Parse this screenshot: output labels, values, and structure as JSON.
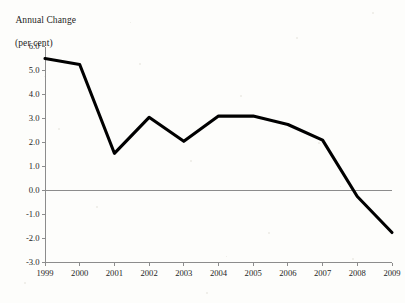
{
  "chart_data": {
    "type": "line",
    "title": "",
    "ylabel_line1": "Annual Change",
    "ylabel_line2": "(per cent)",
    "xlabel": "Year",
    "categories": [
      "1999",
      "2000",
      "2001",
      "2002",
      "2003",
      "2004",
      "2005",
      "2006",
      "2007",
      "2008",
      "2009"
    ],
    "x": [
      1999,
      2000,
      2001,
      2002,
      2003,
      2004,
      2005,
      2006,
      2007,
      2008,
      2009
    ],
    "values": [
      5.5,
      5.25,
      1.55,
      3.05,
      2.05,
      3.1,
      3.1,
      2.75,
      2.1,
      -0.25,
      -1.75
    ],
    "series": [
      {
        "name": "Annual Change (per cent)",
        "values": [
          5.5,
          5.25,
          1.55,
          3.05,
          2.05,
          3.1,
          3.1,
          2.75,
          2.1,
          -0.25,
          -1.75
        ],
        "color": "#000000"
      }
    ],
    "ylim": [
      -3.0,
      6.0
    ],
    "xlim": [
      1999,
      2009
    ],
    "yticks": [
      6.0,
      5.0,
      4.0,
      3.0,
      2.0,
      1.0,
      0.0,
      -1.0,
      -2.0,
      -3.0
    ],
    "ytick_labels": [
      "6.0",
      "5.0",
      "4.0",
      "3.0",
      "2.0",
      "1.0",
      "0.0",
      "-1.0",
      "-2.0",
      "-3.0"
    ],
    "xtick_labels": [
      "1999",
      "2000",
      "2001",
      "2002",
      "2003",
      "2004",
      "2005",
      "2006",
      "2007",
      "2008",
      "2009"
    ],
    "grid": false,
    "legend": "none",
    "zero_line": true,
    "zero_line_color": "#8c8c8c",
    "axis_color": "#8c8c8c",
    "line_color": "#000000",
    "background": "#fdfdfb"
  }
}
